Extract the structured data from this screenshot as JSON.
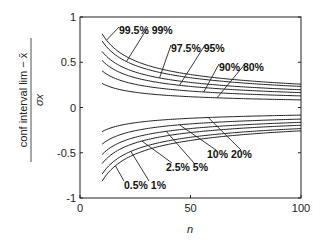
{
  "chart_data": {
    "type": "line",
    "title": "",
    "xlabel": "n",
    "ylabel_numerator": "conf interval lim − x̄",
    "ylabel_denominator": "σx",
    "xlim": [
      0,
      100
    ],
    "ylim": [
      -1,
      1
    ],
    "xticks": [
      0,
      50,
      100
    ],
    "xtick_labels": [
      "0",
      "50",
      "100"
    ],
    "yticks": [
      1,
      0.5,
      0,
      -0.5,
      -1
    ],
    "ytick_labels": [
      "1",
      "0.5",
      "0",
      "-0.5",
      "-1"
    ],
    "grid": false,
    "n_range": [
      10,
      100
    ],
    "formula": "z_p / sqrt(n)",
    "series": [
      {
        "name": "99.5%",
        "z": 2.5758
      },
      {
        "name": "99%",
        "z": 2.3263
      },
      {
        "name": "97.5%",
        "z": 1.96
      },
      {
        "name": "95%",
        "z": 1.6449
      },
      {
        "name": "90%",
        "z": 1.2816
      },
      {
        "name": "80%",
        "z": 0.8416
      },
      {
        "name": "20%",
        "z": -0.8416
      },
      {
        "name": "10%",
        "z": -1.2816
      },
      {
        "name": "5%",
        "z": -1.6449
      },
      {
        "name": "2.5%",
        "z": -1.96
      },
      {
        "name": "1%",
        "z": -2.3263
      },
      {
        "name": "0.5%",
        "z": -2.5758
      }
    ],
    "annotations": [
      {
        "text": "99.5%  99%",
        "targets": [
          "99.5%",
          "99%"
        ]
      },
      {
        "text": "97.5%  95%",
        "targets": [
          "97.5%",
          "95%"
        ]
      },
      {
        "text": "90%  80%",
        "targets": [
          "90%",
          "80%"
        ]
      },
      {
        "text": "10%  20%",
        "targets": [
          "10%",
          "20%"
        ]
      },
      {
        "text": "2.5%  5%",
        "targets": [
          "2.5%",
          "5%"
        ]
      },
      {
        "text": "0.5%  1%",
        "targets": [
          "0.5%",
          "1%"
        ]
      }
    ]
  }
}
